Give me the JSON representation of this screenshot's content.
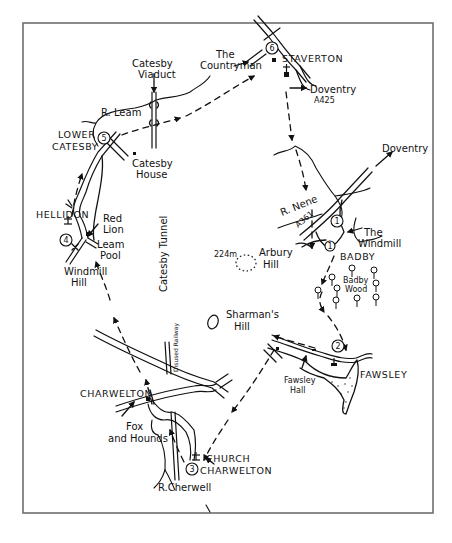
{
  "map": {
    "type": "walking-route-sketch-map",
    "frame_color": "#6e6e6e",
    "ink_color": "#111111",
    "background": "#ffffff",
    "waypoints": [
      {
        "number": "1",
        "place": "Badby",
        "near": "The Windmill"
      },
      {
        "number": "2",
        "place": "Fawsley",
        "near": "Fawsley Hall"
      },
      {
        "number": "3",
        "place": "Church Charwelton",
        "near": "Church"
      },
      {
        "number": "4",
        "place": "Hellidon",
        "near": "Windmill Hill"
      },
      {
        "number": "5",
        "place": "Lower Catesby",
        "near": "Catesby House"
      },
      {
        "number": "6",
        "place": "Staverton",
        "near": "The Countryman"
      }
    ],
    "labels": {
      "catesby_viaduct_1": "Catesby",
      "catesby_viaduct_2": "Viaduct",
      "countryman_1": "The",
      "countryman_2": "Countryman",
      "staverton": "STAVERTON",
      "doventry_a425_1": "Doventry",
      "doventry_a425_2": "A425",
      "r_leam": "R. Leam",
      "lower_catesby_1": "LOWER",
      "lower_catesby_2": "CATESBY",
      "catesby_house_1": "Catesby",
      "catesby_house_2": "House",
      "doventry_east": "Doventry",
      "r_nene": "R. Nene",
      "a361": "A361",
      "the_windmill_1": "The",
      "the_windmill_2": "Windmill",
      "badby": "BADBY",
      "hellidon": "HELLIDON",
      "red_lion_1": "Red",
      "red_lion_2": "Lion",
      "leam_pool_1": "Leam",
      "leam_pool_2": "Pool",
      "windmill_hill_1": "Windmill",
      "windmill_hill_2": "Hill",
      "catesby_tunnel": "Catesby Tunnel",
      "arbury_height": "224m",
      "arbury_hill_1": "Arbury",
      "arbury_hill_2": "Hill",
      "badby_wood_1": "Badby",
      "badby_wood_2": "Wood",
      "shermans_hill_1": "Sharman's",
      "shermans_hill_2": "Hill",
      "disused_railway": "Disused Railway",
      "charwelton": "CHARWELTON",
      "fawsley": "FAWSLEY",
      "fawsley_hall_1": "Fawsley",
      "fawsley_hall_2": "Hall",
      "fox_hounds_1": "Fox",
      "fox_hounds_2": "and Hounds",
      "church_charwelton_1": "CHURCH",
      "church_charwelton_2": "CHARWELTON",
      "r_cherwell": "R.Cherwell"
    },
    "icons": [
      "church-icon",
      "pub-icon",
      "windmill-icon",
      "tree-icon",
      "hill-contour-icon",
      "route-arrow-icon"
    ]
  }
}
